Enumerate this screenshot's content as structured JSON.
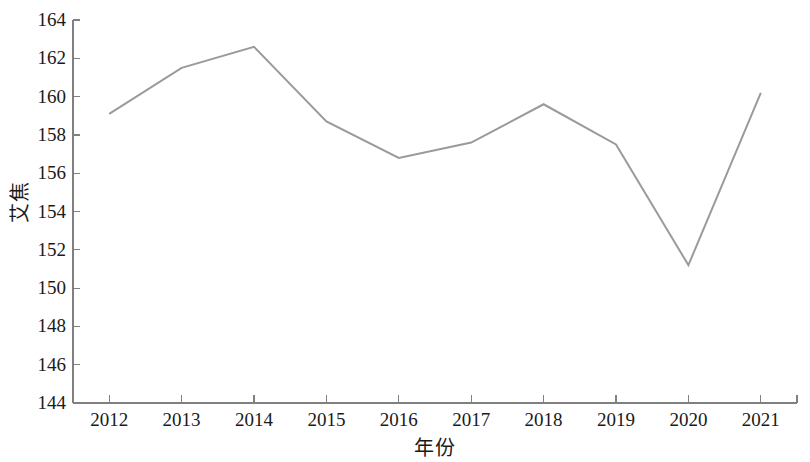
{
  "chart_data": {
    "type": "line",
    "title": "",
    "xlabel": "年份",
    "ylabel": "艾焦",
    "categories": [
      "2012",
      "2013",
      "2014",
      "2015",
      "2016",
      "2017",
      "2018",
      "2019",
      "2020",
      "2021"
    ],
    "x": [
      2012,
      2013,
      2014,
      2015,
      2016,
      2017,
      2018,
      2019,
      2020,
      2021
    ],
    "values": [
      159.1,
      161.5,
      162.6,
      158.7,
      156.8,
      157.6,
      159.6,
      157.5,
      151.2,
      160.2
    ],
    "series": [
      {
        "name": "艾焦",
        "color": "#9a9a9a",
        "values": [
          159.1,
          161.5,
          162.6,
          158.7,
          156.8,
          157.6,
          159.6,
          157.5,
          151.2,
          160.2
        ]
      }
    ],
    "ylim": [
      144,
      164
    ],
    "yticks": [
      144,
      146,
      148,
      150,
      152,
      154,
      156,
      158,
      160,
      162,
      164
    ],
    "ytick_labels": [
      "144",
      "146",
      "148",
      "150",
      "152",
      "154",
      "156",
      "158",
      "160",
      "162",
      "164"
    ],
    "xlim": [
      2011.5,
      2021.5
    ],
    "xticks": [
      2012,
      2013,
      2014,
      2015,
      2016,
      2017,
      2018,
      2019,
      2020,
      2021
    ],
    "grid": false,
    "legend": null,
    "legend_position": "none",
    "axis_color": "#808080",
    "line_width": 2,
    "markers": false
  },
  "axes": {
    "y_title": "艾焦",
    "x_title": "年份"
  }
}
